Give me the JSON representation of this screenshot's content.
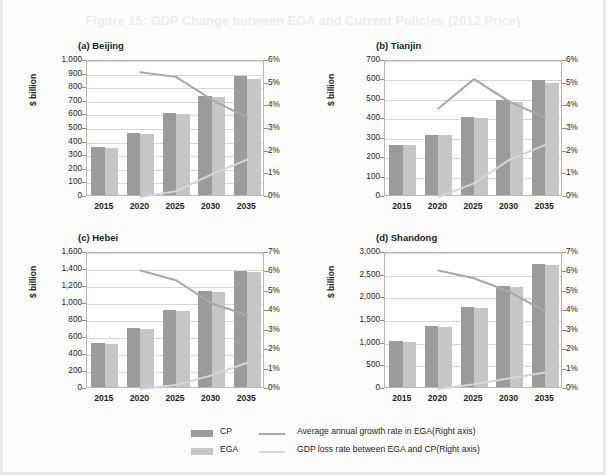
{
  "figure": {
    "title": "Figure 15: GDP Change between EGA and Current Policies (2012 Price)"
  },
  "legend": {
    "cp_label": "CP",
    "ega_label": "EGA",
    "growth_label": "Average annual growth rate in EGA(Right axis)",
    "loss_label": "GDP loss rate between EGA and CP(Right axis)",
    "cp_color": "#9b9b9b",
    "ega_color": "#c6c6c6",
    "growth_color": "#a8a8a8",
    "loss_color": "#d5d5d5"
  },
  "chart_data": [
    {
      "type": "bar",
      "panel": "a",
      "title": "(a) Beijing",
      "categories": [
        "2015",
        "2020",
        "2025",
        "2030",
        "2035"
      ],
      "ylabel": "$ billion",
      "xlabel": "",
      "ylim": [
        0,
        1000
      ],
      "yticks": [
        "0",
        "100",
        "200",
        "300",
        "400",
        "500",
        "600",
        "700",
        "800",
        "900",
        "1,000"
      ],
      "ytickvals": [
        0,
        100,
        200,
        300,
        400,
        500,
        600,
        700,
        800,
        900,
        1000
      ],
      "y2lim": [
        0,
        6
      ],
      "y2ticks": [
        "0%",
        "1%",
        "2%",
        "3%",
        "4%",
        "5%",
        "6%"
      ],
      "y2tickvals": [
        0,
        1,
        2,
        3,
        4,
        5,
        6
      ],
      "grid": true,
      "series": [
        {
          "name": "CP",
          "kind": "bar",
          "values": [
            350,
            455,
            600,
            730,
            875
          ]
        },
        {
          "name": "EGA",
          "kind": "bar",
          "values": [
            345,
            450,
            595,
            720,
            855
          ]
        },
        {
          "name": "Average annual growth rate in EGA(Right axis)",
          "kind": "line",
          "axis": "right",
          "x": [
            "2020",
            "2025",
            "2030",
            "2035"
          ],
          "values": [
            5.5,
            5.3,
            4.3,
            3.5
          ]
        },
        {
          "name": "GDP loss rate between EGA and CP(Right axis)",
          "kind": "line",
          "axis": "right",
          "x": [
            "2020",
            "2025",
            "2030",
            "2035"
          ],
          "values": [
            0.0,
            0.25,
            1.0,
            1.65
          ]
        }
      ]
    },
    {
      "type": "bar",
      "panel": "b",
      "title": "(b) Tianjin",
      "categories": [
        "2015",
        "2020",
        "2025",
        "2030",
        "2035"
      ],
      "ylabel": "$ billion",
      "xlabel": "",
      "ylim": [
        0,
        700
      ],
      "yticks": [
        "0",
        "100",
        "200",
        "300",
        "400",
        "500",
        "600",
        "700"
      ],
      "ytickvals": [
        0,
        100,
        200,
        300,
        400,
        500,
        600,
        700
      ],
      "y2lim": [
        0,
        6
      ],
      "y2ticks": [
        "0%",
        "1%",
        "2%",
        "3%",
        "4%",
        "5%",
        "6%"
      ],
      "y2tickvals": [
        0,
        1,
        2,
        3,
        4,
        5,
        6
      ],
      "grid": true,
      "series": [
        {
          "name": "CP",
          "kind": "bar",
          "values": [
            258,
            310,
            403,
            490,
            593
          ]
        },
        {
          "name": "EGA",
          "kind": "bar",
          "values": [
            255,
            308,
            398,
            480,
            577
          ]
        },
        {
          "name": "Average annual growth rate in EGA(Right axis)",
          "kind": "line",
          "axis": "right",
          "x": [
            "2020",
            "2025",
            "2030",
            "2035"
          ],
          "values": [
            3.9,
            5.2,
            4.2,
            3.5
          ]
        },
        {
          "name": "GDP loss rate between EGA and CP(Right axis)",
          "kind": "line",
          "axis": "right",
          "x": [
            "2020",
            "2025",
            "2030",
            "2035"
          ],
          "values": [
            0.0,
            0.6,
            1.65,
            2.3
          ]
        }
      ]
    },
    {
      "type": "bar",
      "panel": "c",
      "title": "(c) Hebei",
      "categories": [
        "2015",
        "2020",
        "2025",
        "2030",
        "2035"
      ],
      "ylabel": "$ billion",
      "xlabel": "",
      "ylim": [
        0,
        1600
      ],
      "yticks": [
        "0",
        "200",
        "400",
        "600",
        "800",
        "1,000",
        "1,200",
        "1,400",
        "1,600"
      ],
      "ytickvals": [
        0,
        200,
        400,
        600,
        800,
        1000,
        1200,
        1400,
        1600
      ],
      "y2lim": [
        0,
        7
      ],
      "y2ticks": [
        "0%",
        "1%",
        "2%",
        "3%",
        "4%",
        "5%",
        "6%",
        "7%"
      ],
      "y2tickvals": [
        0,
        1,
        2,
        3,
        4,
        5,
        6,
        7
      ],
      "grid": true,
      "series": [
        {
          "name": "CP",
          "kind": "bar",
          "values": [
            515,
            690,
            910,
            1130,
            1370
          ]
        },
        {
          "name": "EGA",
          "kind": "bar",
          "values": [
            505,
            685,
            900,
            1120,
            1350
          ]
        },
        {
          "name": "Average annual growth rate in EGA(Right axis)",
          "kind": "line",
          "axis": "right",
          "x": [
            "2020",
            "2025",
            "2030",
            "2035"
          ],
          "values": [
            6.1,
            5.6,
            4.4,
            3.8
          ]
        },
        {
          "name": "GDP loss rate between EGA and CP(Right axis)",
          "kind": "line",
          "axis": "right",
          "x": [
            "2020",
            "2025",
            "2030",
            "2035"
          ],
          "values": [
            0.0,
            0.2,
            0.7,
            1.35
          ]
        }
      ]
    },
    {
      "type": "bar",
      "panel": "d",
      "title": "(d) Shandong",
      "categories": [
        "2015",
        "2020",
        "2025",
        "2030",
        "2035"
      ],
      "ylabel": "$ billion",
      "xlabel": "",
      "ylim": [
        0,
        3000
      ],
      "yticks": [
        "0",
        "500",
        "1,000",
        "1,500",
        "2,000",
        "2,500",
        "3,000"
      ],
      "ytickvals": [
        0,
        500,
        1000,
        1500,
        2000,
        2500,
        3000
      ],
      "y2lim": [
        0,
        7
      ],
      "y2ticks": [
        "0%",
        "1%",
        "2%",
        "3%",
        "4%",
        "5%",
        "6%",
        "7%"
      ],
      "y2tickvals": [
        0,
        1,
        2,
        3,
        4,
        5,
        6,
        7
      ],
      "grid": true,
      "series": [
        {
          "name": "CP",
          "kind": "bar",
          "values": [
            1010,
            1350,
            1770,
            2230,
            2720
          ]
        },
        {
          "name": "EGA",
          "kind": "bar",
          "values": [
            1000,
            1330,
            1750,
            2210,
            2690
          ]
        },
        {
          "name": "Average annual growth rate in EGA(Right axis)",
          "kind": "line",
          "axis": "right",
          "x": [
            "2020",
            "2025",
            "2030",
            "2035"
          ],
          "values": [
            6.1,
            5.7,
            5.0,
            4.0
          ]
        },
        {
          "name": "GDP loss rate between EGA and CP(Right axis)",
          "kind": "line",
          "axis": "right",
          "x": [
            "2020",
            "2025",
            "2030",
            "2035"
          ],
          "values": [
            0.0,
            0.25,
            0.55,
            0.85
          ]
        }
      ]
    }
  ]
}
